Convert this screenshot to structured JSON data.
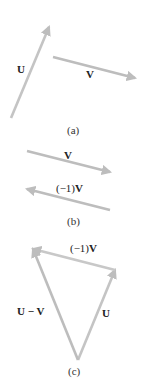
{
  "colors": {
    "arrow": "#bdbdbd",
    "text": "#222222"
  },
  "panels": [
    {
      "caption": "(a)",
      "arrows": [
        {
          "name": "U",
          "label": "U",
          "from": [
            11,
            118
          ],
          "to": [
            49,
            27
          ]
        },
        {
          "name": "V",
          "label": "V",
          "from": [
            53,
            57
          ],
          "to": [
            135,
            78
          ]
        }
      ]
    },
    {
      "caption": "(b)",
      "arrows": [
        {
          "name": "V",
          "label": "V",
          "from": [
            27,
            151
          ],
          "to": [
            110,
            172
          ]
        },
        {
          "name": "negV",
          "label_prefix": "(−1)",
          "label_bold": "V",
          "from": [
            110,
            210
          ],
          "to": [
            27,
            189
          ]
        }
      ]
    },
    {
      "caption": "(c)",
      "arrows": [
        {
          "name": "U",
          "label": "U",
          "from": [
            78,
            360
          ],
          "to": [
            115,
            270
          ]
        },
        {
          "name": "negV",
          "label_prefix": "(−1)",
          "label_bold": "V",
          "from": [
            115,
            270
          ],
          "to": [
            33,
            249
          ]
        },
        {
          "name": "U-minus-V",
          "label": "U − V",
          "from": [
            78,
            360
          ],
          "to": [
            33,
            249
          ]
        }
      ]
    }
  ]
}
